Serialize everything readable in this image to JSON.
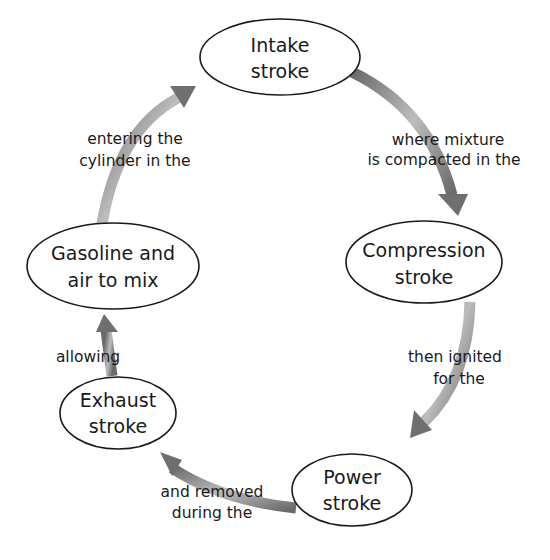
{
  "diagram": {
    "type": "cycle",
    "nodes": [
      {
        "id": "intake",
        "line1": "Intake",
        "line2": "stroke"
      },
      {
        "id": "compression",
        "line1": "Compression",
        "line2": "stroke"
      },
      {
        "id": "power",
        "line1": "Power",
        "line2": "stroke"
      },
      {
        "id": "exhaust",
        "line1": "Exhaust",
        "line2": "stroke"
      },
      {
        "id": "gasoline",
        "line1": "Gasoline and",
        "line2": "air to mix"
      }
    ],
    "edges": [
      {
        "from": "intake",
        "to": "compression",
        "line1": "where mixture",
        "line2": "is compacted in the"
      },
      {
        "from": "compression",
        "to": "power",
        "line1": "then ignited",
        "line2": "for the"
      },
      {
        "from": "power",
        "to": "exhaust",
        "line1": "and removed",
        "line2": "during the"
      },
      {
        "from": "exhaust",
        "to": "gasoline",
        "line1": "allowing",
        "line2": ""
      },
      {
        "from": "gasoline",
        "to": "intake",
        "line1": "entering the",
        "line2": "cylinder in the"
      }
    ],
    "colors": {
      "arrow_dark": "#6a6a6a",
      "arrow_light": "#d8d8d8",
      "outline": "#1a1a1a",
      "text": "#1a1a1a"
    }
  }
}
